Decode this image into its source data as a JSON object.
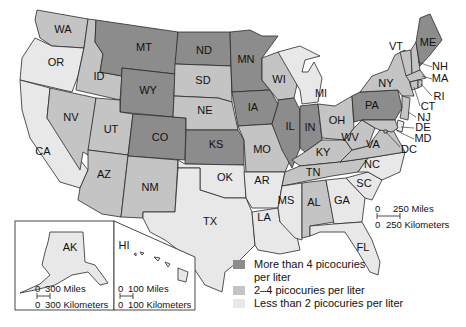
{
  "map": {
    "subject": "Radon levels by region, United States",
    "colors": {
      "high": "#8c8c8c",
      "medium": "#c4c4c4",
      "low": "#e8e8e8",
      "border": "#2a2a2a",
      "background": "#ffffff"
    },
    "states": [
      {
        "id": "WA",
        "label": "WA",
        "level": "medium"
      },
      {
        "id": "OR",
        "label": "OR",
        "level": "low"
      },
      {
        "id": "CA",
        "label": "CA",
        "level": "low"
      },
      {
        "id": "ID",
        "label": "ID",
        "level": "medium"
      },
      {
        "id": "NV",
        "label": "NV",
        "level": "medium"
      },
      {
        "id": "MT",
        "label": "MT",
        "level": "high"
      },
      {
        "id": "WY",
        "label": "WY",
        "level": "high"
      },
      {
        "id": "UT",
        "label": "UT",
        "level": "medium"
      },
      {
        "id": "CO",
        "label": "CO",
        "level": "high"
      },
      {
        "id": "AZ",
        "label": "AZ",
        "level": "medium"
      },
      {
        "id": "NM",
        "label": "NM",
        "level": "medium"
      },
      {
        "id": "ND",
        "label": "ND",
        "level": "high"
      },
      {
        "id": "SD",
        "label": "SD",
        "level": "medium"
      },
      {
        "id": "NE",
        "label": "NE",
        "level": "medium"
      },
      {
        "id": "KS",
        "label": "KS",
        "level": "high"
      },
      {
        "id": "OK",
        "label": "OK",
        "level": "low"
      },
      {
        "id": "TX",
        "label": "TX",
        "level": "low"
      },
      {
        "id": "MN",
        "label": "MN",
        "level": "high"
      },
      {
        "id": "IA",
        "label": "IA",
        "level": "high"
      },
      {
        "id": "MO",
        "label": "MO",
        "level": "medium"
      },
      {
        "id": "AR",
        "label": "AR",
        "level": "low"
      },
      {
        "id": "LA",
        "label": "LA",
        "level": "low"
      },
      {
        "id": "WI",
        "label": "WI",
        "level": "medium"
      },
      {
        "id": "IL",
        "label": "IL",
        "level": "high"
      },
      {
        "id": "MI",
        "label": "MI",
        "level": "low"
      },
      {
        "id": "IN",
        "label": "IN",
        "level": "high"
      },
      {
        "id": "OH",
        "label": "OH",
        "level": "medium"
      },
      {
        "id": "KY",
        "label": "KY",
        "level": "medium"
      },
      {
        "id": "TN",
        "label": "TN",
        "level": "medium"
      },
      {
        "id": "MS",
        "label": "MS",
        "level": "low"
      },
      {
        "id": "AL",
        "label": "AL",
        "level": "medium"
      },
      {
        "id": "GA",
        "label": "GA",
        "level": "low"
      },
      {
        "id": "FL",
        "label": "FL",
        "level": "low"
      },
      {
        "id": "SC",
        "label": "SC",
        "level": "low"
      },
      {
        "id": "NC",
        "label": "NC",
        "level": "low"
      },
      {
        "id": "VA",
        "label": "VA",
        "level": "medium"
      },
      {
        "id": "WV",
        "label": "WV",
        "level": "medium"
      },
      {
        "id": "PA",
        "label": "PA",
        "level": "high"
      },
      {
        "id": "NY",
        "label": "NY",
        "level": "medium"
      },
      {
        "id": "VT",
        "label": "VT",
        "level": "medium"
      },
      {
        "id": "NH",
        "label": "NH",
        "level": "medium"
      },
      {
        "id": "ME",
        "label": "ME",
        "level": "high"
      },
      {
        "id": "MA",
        "label": "MA",
        "level": "medium"
      },
      {
        "id": "RI",
        "label": "RI",
        "level": "medium"
      },
      {
        "id": "CT",
        "label": "CT",
        "level": "medium"
      },
      {
        "id": "NJ",
        "label": "NJ",
        "level": "medium"
      },
      {
        "id": "DE",
        "label": "DE",
        "level": "low"
      },
      {
        "id": "MD",
        "label": "MD",
        "level": "medium"
      },
      {
        "id": "DC",
        "label": "DC",
        "level": "medium"
      },
      {
        "id": "AK",
        "label": "AK",
        "level": "low"
      },
      {
        "id": "HI",
        "label": "HI",
        "level": "low"
      }
    ],
    "callout_labels": [
      "NH",
      "MA",
      "RI",
      "CT",
      "NJ",
      "DE",
      "MD",
      "DC"
    ],
    "scales": {
      "main": {
        "miles": "250 Miles",
        "km": "250 Kilometers",
        "zero": "0"
      },
      "alaska": {
        "miles": "300 Miles",
        "km": "300 Kilometers",
        "zero": "0"
      },
      "hawaii": {
        "miles": "100 Miles",
        "km": "100 Kilometers",
        "zero": "0"
      }
    },
    "insets": [
      {
        "id": "alaska",
        "label": "AK"
      },
      {
        "id": "hawaii",
        "label": "HI"
      }
    ]
  },
  "legend": {
    "items": [
      {
        "level": "high",
        "text_line1": "More than 4 picocuries",
        "text_line2": "per liter"
      },
      {
        "level": "medium",
        "text_line1": "2–4 picocuries per liter",
        "text_line2": ""
      },
      {
        "level": "low",
        "text_line1": "Less than 2 picocuries per liter",
        "text_line2": ""
      }
    ]
  }
}
